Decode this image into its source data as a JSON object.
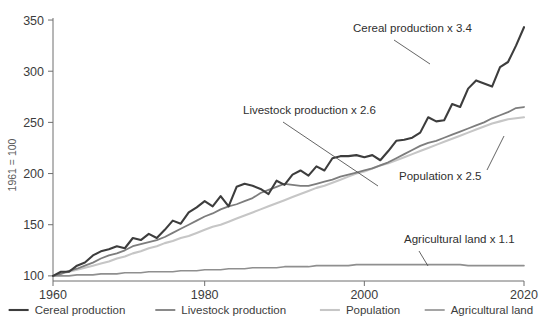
{
  "chart_data": {
    "type": "line",
    "title": "",
    "subtitle": "",
    "xlabel": "",
    "ylabel": "1961 = 100",
    "xlim": [
      1961,
      2020
    ],
    "ylim": [
      95,
      352
    ],
    "grid": false,
    "legend_position": "bottom",
    "x_ticks": [
      "1960",
      "1980",
      "2000",
      "2020"
    ],
    "x_tick_values": [
      1960,
      1980,
      2000,
      2020
    ],
    "y_ticks": [
      "100",
      "150",
      "200",
      "250",
      "300",
      "350"
    ],
    "y_tick_values": [
      100,
      150,
      200,
      250,
      300,
      350
    ],
    "x": [
      1961,
      1962,
      1963,
      1964,
      1965,
      1966,
      1967,
      1968,
      1969,
      1970,
      1971,
      1972,
      1973,
      1974,
      1975,
      1976,
      1977,
      1978,
      1979,
      1980,
      1981,
      1982,
      1983,
      1984,
      1985,
      1986,
      1987,
      1988,
      1989,
      1990,
      1991,
      1992,
      1993,
      1994,
      1995,
      1996,
      1997,
      1998,
      1999,
      2000,
      2001,
      2002,
      2003,
      2004,
      2005,
      2006,
      2007,
      2008,
      2009,
      2010,
      2011,
      2012,
      2013,
      2014,
      2015,
      2016,
      2017,
      2018,
      2019,
      2020
    ],
    "series": [
      {
        "name": "Cereal production",
        "color": "#3d3d3d",
        "width": 2.1,
        "multiplier_label": "x 3.4",
        "end_value": 343,
        "values": [
          100,
          104,
          104,
          110,
          113,
          120,
          124,
          126,
          129,
          127,
          137,
          135,
          141,
          137,
          145,
          154,
          151,
          162,
          167,
          173,
          168,
          178,
          168,
          187,
          190,
          188,
          185,
          180,
          193,
          189,
          199,
          203,
          198,
          207,
          203,
          215,
          217,
          217,
          218,
          216,
          218,
          213,
          222,
          232,
          233,
          235,
          240,
          255,
          251,
          252,
          268,
          265,
          283,
          291,
          288,
          285,
          304,
          309,
          325,
          343
        ]
      },
      {
        "name": "Livestock production",
        "color": "#7d7d7d",
        "width": 1.8,
        "multiplier_label": "x 2.6",
        "end_value": 265,
        "values": [
          100,
          102,
          105,
          107,
          110,
          113,
          117,
          120,
          122,
          125,
          129,
          131,
          133,
          135,
          138,
          142,
          146,
          150,
          154,
          158,
          161,
          165,
          168,
          170,
          173,
          176,
          181,
          184,
          187,
          190,
          189,
          188,
          188,
          190,
          192,
          194,
          197,
          199,
          201,
          203,
          205,
          208,
          211,
          215,
          219,
          223,
          227,
          230,
          232,
          235,
          238,
          241,
          244,
          247,
          250,
          254,
          257,
          260,
          264,
          265
        ]
      },
      {
        "name": "Population",
        "color": "#c6c6c6",
        "width": 2.1,
        "multiplier_label": "x 2.5",
        "end_value": 255,
        "values": [
          100,
          102,
          104,
          106,
          108,
          110,
          112,
          114,
          117,
          119,
          122,
          124,
          127,
          129,
          132,
          134,
          137,
          139,
          142,
          145,
          148,
          150,
          153,
          156,
          159,
          162,
          165,
          168,
          171,
          174,
          177,
          180,
          183,
          186,
          188,
          191,
          194,
          197,
          200,
          202,
          205,
          208,
          210,
          213,
          216,
          219,
          222,
          225,
          228,
          231,
          234,
          237,
          240,
          243,
          246,
          249,
          251,
          253,
          254,
          255
        ]
      },
      {
        "name": "Agricultural land",
        "color": "#8f8f8f",
        "width": 1.6,
        "multiplier_label": "x 1.1",
        "end_value": 110,
        "values": [
          100,
          100,
          100,
          101,
          101,
          101,
          102,
          102,
          102,
          103,
          103,
          103,
          104,
          104,
          104,
          104,
          105,
          105,
          105,
          106,
          106,
          106,
          107,
          107,
          107,
          108,
          108,
          108,
          108,
          109,
          109,
          109,
          109,
          110,
          110,
          110,
          110,
          110,
          111,
          111,
          111,
          111,
          111,
          111,
          111,
          111,
          111,
          111,
          111,
          111,
          111,
          111,
          110,
          110,
          110,
          110,
          110,
          110,
          110,
          110
        ]
      }
    ],
    "annotations": [
      {
        "id": "cereal",
        "text": "Cereal production x 3.4"
      },
      {
        "id": "livestock",
        "text": "Livestock production x 2.6"
      },
      {
        "id": "population",
        "text": "Population x 2.5"
      },
      {
        "id": "agland",
        "text": "Agricultural land x 1.1"
      }
    ],
    "legend": [
      {
        "label": "Cereal production",
        "color": "#3d3d3d"
      },
      {
        "label": "Livestock production",
        "color": "#7d7d7d"
      },
      {
        "label": "Population",
        "color": "#c6c6c6"
      },
      {
        "label": "Agricultural land",
        "color": "#8f8f8f"
      }
    ]
  }
}
